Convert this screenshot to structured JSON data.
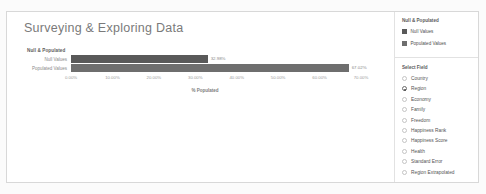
{
  "report": {
    "title": "Surveying & Exploring Data"
  },
  "chart_data": {
    "type": "bar",
    "orientation": "horizontal",
    "title": "Null & Populated",
    "categories": [
      "Null Values",
      "Populated Values"
    ],
    "values": [
      32.98,
      67.02
    ],
    "value_labels": [
      "32.98%",
      "67.02%"
    ],
    "xlabel": "% Populated",
    "ylabel": "",
    "xlim": [
      0,
      70
    ],
    "xticks": [
      "0.00%",
      "10.00%",
      "20.00%",
      "30.00%",
      "40.00%",
      "50.00%",
      "60.00%",
      "70.00%"
    ],
    "xtick_values": [
      0,
      10,
      20,
      30,
      40,
      50,
      60,
      70
    ],
    "grid": false,
    "legend_position": "right",
    "series_colors": [
      "#595959",
      "#6e6e6e"
    ]
  },
  "legend_panel": {
    "title": "Null & Populated",
    "items": [
      {
        "label": "Null Values",
        "color": "#595959"
      },
      {
        "label": "Populated Values",
        "color": "#6e6e6e"
      }
    ]
  },
  "field_panel": {
    "title": "Select Field",
    "selected": "Region",
    "options": [
      {
        "label": "Country",
        "selected": false
      },
      {
        "label": "Region",
        "selected": true
      },
      {
        "label": "Economy",
        "selected": false
      },
      {
        "label": "Family",
        "selected": false
      },
      {
        "label": "Freedom",
        "selected": false
      },
      {
        "label": "Happiness Rank",
        "selected": false
      },
      {
        "label": "Happiness Score",
        "selected": false
      },
      {
        "label": "Health",
        "selected": false
      },
      {
        "label": "Standard Error",
        "selected": false
      },
      {
        "label": "Region Extrapolated",
        "selected": false
      }
    ]
  }
}
